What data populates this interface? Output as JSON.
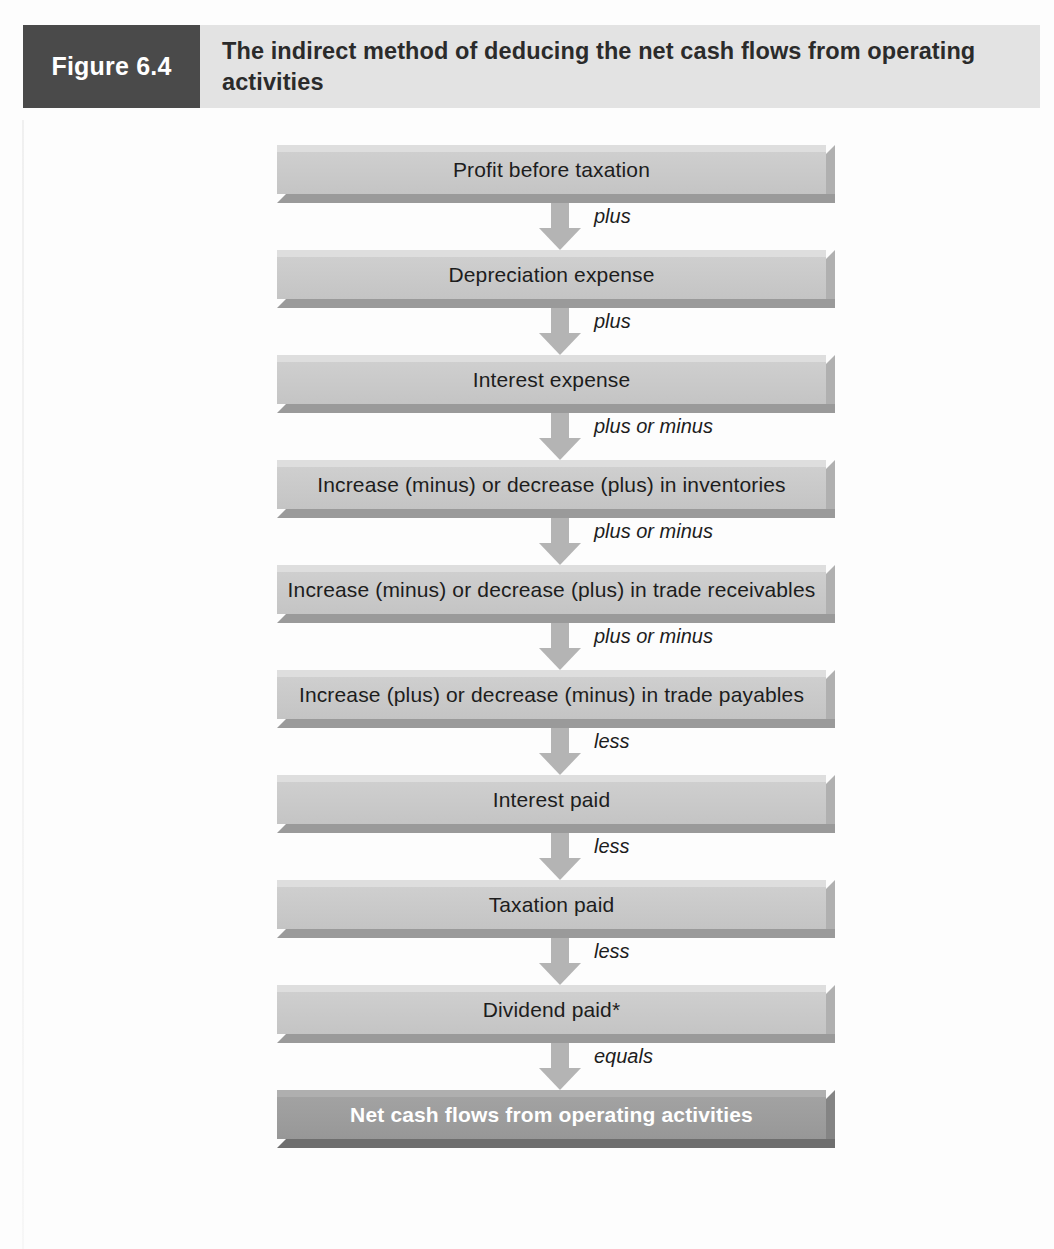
{
  "figure": {
    "number_label": "Figure 6.4",
    "title": "The indirect method of deducing the net cash flows from operating activities"
  },
  "colors": {
    "figure_number_background": "#4a4a4a",
    "figure_title_background": "#e3e3e3",
    "node_fill": "#c9c9c9",
    "node_shadow": "#9a9a9a",
    "result_node_fill": "#9c9c9c",
    "arrow_fill": "#b4b4b4",
    "text": "#1d1d1d",
    "result_text": "#ffffff"
  },
  "chart_data": {
    "type": "diagram",
    "title": "The indirect method of deducing the net cash flows from operating activities",
    "orientation": "vertical",
    "nodes": [
      {
        "id": "profit-before-taxation",
        "label": "Profit before taxation",
        "emphasis": "normal"
      },
      {
        "id": "depreciation-expense",
        "label": "Depreciation expense",
        "emphasis": "normal"
      },
      {
        "id": "interest-expense",
        "label": "Interest expense",
        "emphasis": "normal"
      },
      {
        "id": "inventories",
        "label": "Increase (minus) or decrease (plus) in inventories",
        "emphasis": "normal"
      },
      {
        "id": "trade-receivables",
        "label": "Increase (minus) or decrease (plus) in trade receivables",
        "emphasis": "normal"
      },
      {
        "id": "trade-payables",
        "label": "Increase (plus) or decrease (minus) in trade payables",
        "emphasis": "normal"
      },
      {
        "id": "interest-paid",
        "label": "Interest paid",
        "emphasis": "normal"
      },
      {
        "id": "taxation-paid",
        "label": "Taxation paid",
        "emphasis": "normal"
      },
      {
        "id": "dividend-paid",
        "label": "Dividend paid*",
        "emphasis": "normal"
      },
      {
        "id": "net-cash-flows",
        "label": "Net cash flows from operating activities",
        "emphasis": "result"
      }
    ],
    "connectors": [
      {
        "from": "profit-before-taxation",
        "to": "depreciation-expense",
        "label": "plus"
      },
      {
        "from": "depreciation-expense",
        "to": "interest-expense",
        "label": "plus"
      },
      {
        "from": "interest-expense",
        "to": "inventories",
        "label": "plus or minus"
      },
      {
        "from": "inventories",
        "to": "trade-receivables",
        "label": "plus or minus"
      },
      {
        "from": "trade-receivables",
        "to": "trade-payables",
        "label": "plus or minus"
      },
      {
        "from": "trade-payables",
        "to": "interest-paid",
        "label": "less"
      },
      {
        "from": "interest-paid",
        "to": "taxation-paid",
        "label": "less"
      },
      {
        "from": "taxation-paid",
        "to": "dividend-paid",
        "label": "less"
      },
      {
        "from": "dividend-paid",
        "to": "net-cash-flows",
        "label": "equals"
      }
    ]
  }
}
